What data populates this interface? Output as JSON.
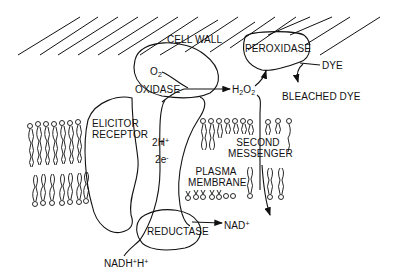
{
  "diagram": {
    "type": "biological-pathway",
    "labels": {
      "cell_wall": "CELL WALL",
      "peroxidase": "PEROXIDASE",
      "dye": "DYE",
      "bleached_dye": "BLEACHED DYE",
      "o2": "O",
      "o2_sub": "2",
      "oxidase": "OXIDASE",
      "h2o2_h": "H",
      "h2o2_sub1": "2",
      "h2o2_o": "O",
      "h2o2_sub2": "2",
      "elicitor_receptor_1": "ELICITOR",
      "elicitor_receptor_2": "RECEPTOR",
      "two_h": "2H",
      "two_h_sup": "+",
      "two_e": "2e",
      "two_e_sup": "-",
      "second_messenger_1": "SECOND",
      "second_messenger_2": "MESSENGER",
      "plasma_membrane_1": "PLASMA",
      "plasma_membrane_2": "MEMBRANE",
      "reductase": "REDUCTASE",
      "nad": "NAD",
      "nad_sup": "+",
      "nadh": "NADH",
      "nadh_sup": "+",
      "nadh_h": "H",
      "nadh_h_sup": "+"
    },
    "flows": [
      {
        "from": "O2",
        "to": "H2O2",
        "via": "OXIDASE"
      },
      {
        "from": "H2O2",
        "to": "PEROXIDASE"
      },
      {
        "from": "DYE",
        "to": "BLEACHED DYE",
        "via": "PEROXIDASE"
      },
      {
        "from": "H2O2",
        "to": "SECOND MESSENGER"
      },
      {
        "from": "NADH+H+",
        "to": "NAD+",
        "via": "REDUCTASE"
      },
      {
        "from": "REDUCTASE",
        "to": "OXIDASE",
        "carrier": "2H+ / 2e-"
      }
    ]
  }
}
